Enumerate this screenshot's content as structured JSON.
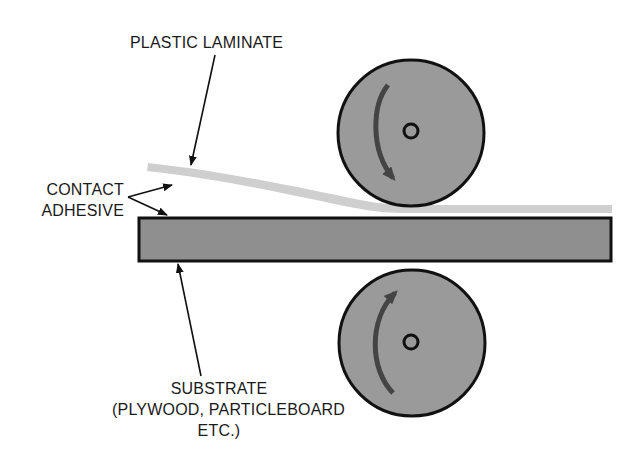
{
  "diagram": {
    "labels": {
      "plastic_laminate": "PLASTIC LAMINATE",
      "contact_adhesive_line1": "CONTACT",
      "contact_adhesive_line2": "ADHESIVE",
      "substrate_line1": "SUBSTRATE",
      "substrate_line2": "(PLYWOOD, PARTICLEBOARD",
      "substrate_line3": "ETC.)"
    },
    "components": [
      {
        "name": "plastic-laminate",
        "shape": "curved-strip",
        "color": "#cfcfcf"
      },
      {
        "name": "substrate",
        "shape": "rectangle",
        "color": "#8f8f8f"
      },
      {
        "name": "top-roller",
        "shape": "circle",
        "rotation": "clockwise",
        "color": "#9a9a9a"
      },
      {
        "name": "bottom-roller",
        "shape": "circle",
        "rotation": "clockwise",
        "color": "#9a9a9a"
      }
    ],
    "colors": {
      "outline": "#111111",
      "roller_fill": "#9a9a9a",
      "substrate_fill": "#8f8f8f",
      "laminate_fill": "#cfcfcf",
      "rotation_arrow": "#444444"
    }
  }
}
